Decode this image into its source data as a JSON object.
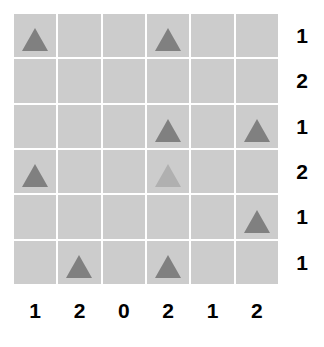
{
  "chart_data": {
    "type": "heatmap",
    "title": "",
    "subtitle": "",
    "xlabel": "",
    "ylabel": "",
    "grid": true,
    "legend_position": "none",
    "rows": 6,
    "cols": 6,
    "cell_background": "#cccccc",
    "gridline_color": "#ffffff",
    "marker_shape": "triangle-up",
    "marker_colors": {
      "dark": "#808080",
      "light": "#b0b0b0"
    },
    "column_labels": [
      "1",
      "2",
      "0",
      "2",
      "1",
      "2"
    ],
    "row_labels": [
      "1",
      "2",
      "1",
      "2",
      "1",
      "1"
    ],
    "column_counts": [
      1,
      2,
      0,
      2,
      1,
      2
    ],
    "row_counts": [
      1,
      2,
      1,
      2,
      1,
      1
    ],
    "markers": [
      {
        "row": 0,
        "col": 0,
        "shade": "dark"
      },
      {
        "row": 0,
        "col": 3,
        "shade": "dark"
      },
      {
        "row": 2,
        "col": 3,
        "shade": "dark"
      },
      {
        "row": 2,
        "col": 5,
        "shade": "dark"
      },
      {
        "row": 3,
        "col": 0,
        "shade": "dark"
      },
      {
        "row": 3,
        "col": 3,
        "shade": "light"
      },
      {
        "row": 4,
        "col": 5,
        "shade": "dark"
      },
      {
        "row": 5,
        "col": 1,
        "shade": "dark"
      },
      {
        "row": 5,
        "col": 3,
        "shade": "dark"
      }
    ],
    "cells": [
      [
        {
          "marker": true,
          "shade": "dark"
        },
        {
          "marker": false
        },
        {
          "marker": false
        },
        {
          "marker": true,
          "shade": "dark"
        },
        {
          "marker": false
        },
        {
          "marker": false
        }
      ],
      [
        {
          "marker": false
        },
        {
          "marker": false
        },
        {
          "marker": false
        },
        {
          "marker": false
        },
        {
          "marker": false
        },
        {
          "marker": false
        }
      ],
      [
        {
          "marker": false
        },
        {
          "marker": false
        },
        {
          "marker": false
        },
        {
          "marker": true,
          "shade": "dark"
        },
        {
          "marker": false
        },
        {
          "marker": true,
          "shade": "dark"
        }
      ],
      [
        {
          "marker": true,
          "shade": "dark"
        },
        {
          "marker": false
        },
        {
          "marker": false
        },
        {
          "marker": true,
          "shade": "light"
        },
        {
          "marker": false
        },
        {
          "marker": false
        }
      ],
      [
        {
          "marker": false
        },
        {
          "marker": false
        },
        {
          "marker": false
        },
        {
          "marker": false
        },
        {
          "marker": false
        },
        {
          "marker": true,
          "shade": "dark"
        }
      ],
      [
        {
          "marker": false
        },
        {
          "marker": true,
          "shade": "dark"
        },
        {
          "marker": false
        },
        {
          "marker": true,
          "shade": "dark"
        },
        {
          "marker": false
        },
        {
          "marker": false
        }
      ]
    ]
  }
}
